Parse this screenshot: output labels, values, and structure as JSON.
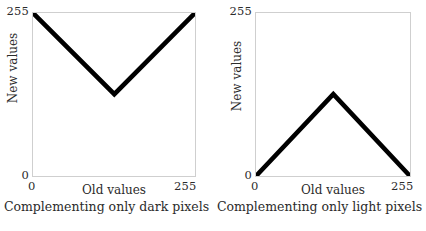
{
  "figure": {
    "background_color": "#ffffff",
    "line_color": "#000000",
    "frame_color": "#cfcfcf",
    "text_color": "#2b2b2b"
  },
  "panels": [
    {
      "caption": "Complementing only dark pixels",
      "xlabel": "Old values",
      "ylabel": "New values",
      "x_tick_min": "0",
      "x_tick_max": "255",
      "y_tick_min": "0",
      "y_tick_max": "255"
    },
    {
      "caption": "Complementing only light pixels",
      "xlabel": "Old values",
      "ylabel": "New values",
      "x_tick_min": "0",
      "x_tick_max": "255",
      "y_tick_min": "0",
      "y_tick_max": "255"
    }
  ],
  "chart_data": [
    {
      "type": "line",
      "title": "Complementing only dark pixels",
      "xlabel": "Old values",
      "ylabel": "New values",
      "xlim": [
        0,
        255
      ],
      "ylim": [
        0,
        255
      ],
      "xticks": [
        0,
        255
      ],
      "yticks": [
        0,
        255
      ],
      "grid": false,
      "legend": null,
      "series": [
        {
          "name": "dark-pixel complement transfer function",
          "x": [
            0,
            128,
            255
          ],
          "y": [
            255,
            128,
            255
          ],
          "color": "#000000",
          "linewidth": 3
        }
      ]
    },
    {
      "type": "line",
      "title": "Complementing only light pixels",
      "xlabel": "Old values",
      "ylabel": "New values",
      "xlim": [
        0,
        255
      ],
      "ylim": [
        0,
        255
      ],
      "xticks": [
        0,
        255
      ],
      "yticks": [
        0,
        255
      ],
      "grid": false,
      "legend": null,
      "series": [
        {
          "name": "light-pixel complement transfer function",
          "x": [
            0,
            128,
            255
          ],
          "y": [
            0,
            128,
            0
          ],
          "color": "#000000",
          "linewidth": 3
        }
      ]
    }
  ]
}
